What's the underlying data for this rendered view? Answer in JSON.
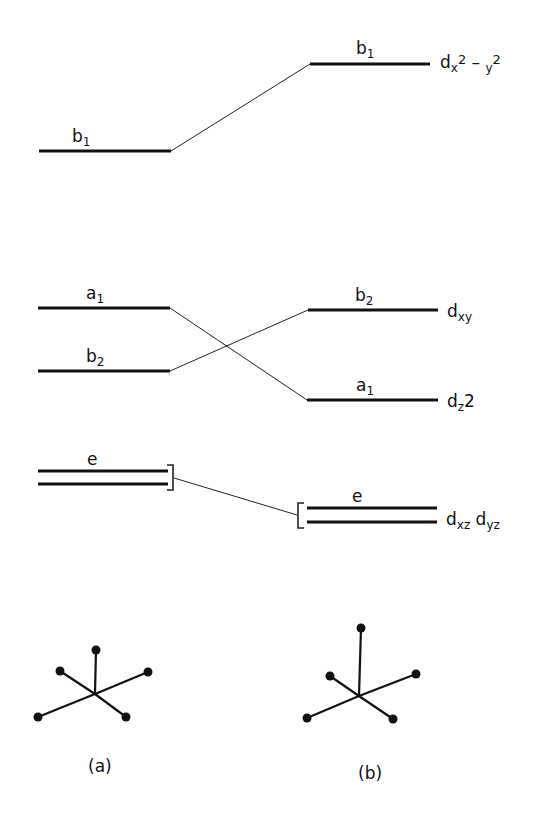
{
  "diagram": {
    "type": "d-orbital correlation diagram",
    "left_column": {
      "levels": [
        {
          "symbol": "b",
          "index": "1",
          "y": 151
        },
        {
          "symbol": "a",
          "index": "1",
          "y": 308
        },
        {
          "symbol": "b",
          "index": "2",
          "y": 371
        },
        {
          "symbol": "e",
          "index": "",
          "y": 477,
          "degenerate": true
        }
      ]
    },
    "right_column": {
      "levels": [
        {
          "symbol": "b",
          "index": "1",
          "y": 64,
          "orbital": {
            "base": "d",
            "sub": "x",
            "sup": "2",
            "mid": " – ",
            "sub2": "y",
            "sup2": "2"
          }
        },
        {
          "symbol": "b",
          "index": "2",
          "y": 310,
          "orbital": {
            "base": "d",
            "sub": "xy"
          }
        },
        {
          "symbol": "a",
          "index": "1",
          "y": 400,
          "orbital": {
            "base": "d",
            "sub": "z",
            "tail": "2"
          }
        },
        {
          "symbol": "e",
          "index": "",
          "y": 515,
          "degenerate": true,
          "orbital": {
            "base1": "d",
            "sub1": "xz",
            "base2": "d",
            "sub2": "yz"
          }
        }
      ]
    },
    "correlations": [
      {
        "from": "left b1",
        "to": "right b1"
      },
      {
        "from": "left a1",
        "to": "right a1"
      },
      {
        "from": "left b2",
        "to": "right b2"
      },
      {
        "from": "left e",
        "to": "right e"
      }
    ],
    "structures": [
      {
        "caption": "(a)",
        "geometry": "square pyramid (short apex)"
      },
      {
        "caption": "(b)",
        "geometry": "square pyramid (elongated apex)"
      }
    ]
  }
}
